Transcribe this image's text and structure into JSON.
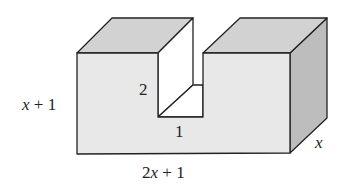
{
  "diagram": {
    "type": "3d-solid-with-rectangular-notch",
    "labels": {
      "height": {
        "var": "x",
        "rest": " + 1"
      },
      "width": {
        "coef": "2",
        "var": "x",
        "rest": " + 1"
      },
      "depth": "x",
      "notch_height": "2",
      "notch_width": "1"
    },
    "colors": {
      "front": "#e8e8e8",
      "top": "#d2d2d2",
      "side": "#bdbdbd",
      "notch_inner": "#ffffff",
      "stroke": "#222222"
    }
  }
}
